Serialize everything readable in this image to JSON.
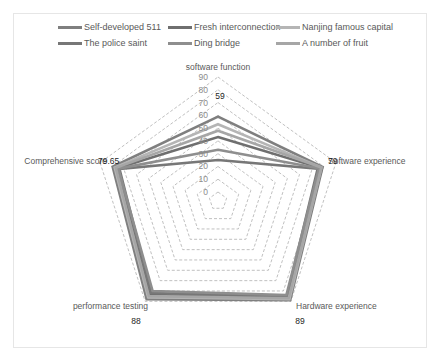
{
  "chart_data": {
    "type": "radar",
    "title": "",
    "axes": [
      "software function",
      "Software experience",
      "Hardware experience",
      "performance testing",
      "Comprehensive score"
    ],
    "rlim": [
      0,
      90
    ],
    "ticks": [
      "0",
      "10",
      "20",
      "30",
      "40",
      "50",
      "60",
      "70",
      "80",
      "90"
    ],
    "grid": true,
    "legend_position": "top",
    "series": [
      {
        "name": "Self-developed 511",
        "color": "#7f7f7f",
        "values": [
          59,
          79,
          89,
          88,
          79.65
        ]
      },
      {
        "name": "Fresh interconnection",
        "color": "#6f6f6f",
        "values": [
          43,
          77,
          86,
          84,
          76
        ]
      },
      {
        "name": "Nanjing famous capital",
        "color": "#b5b5b5",
        "values": [
          53,
          78,
          88,
          86,
          78
        ]
      },
      {
        "name": "The police saint",
        "color": "#777777",
        "values": [
          25,
          75,
          85,
          82,
          74
        ]
      },
      {
        "name": "Ding bridge",
        "color": "#8e8e8e",
        "values": [
          33,
          76,
          84,
          80,
          75
        ]
      },
      {
        "name": "A number of fruit",
        "color": "#a6a6a6",
        "values": [
          48,
          78,
          87,
          85,
          77
        ]
      }
    ],
    "data_labels": [
      {
        "axis": "software function",
        "text": "59"
      },
      {
        "axis": "Software experience",
        "text": "79"
      },
      {
        "axis": "Hardware experience",
        "text": "89"
      },
      {
        "axis": "performance testing",
        "text": "88"
      },
      {
        "axis": "Comprehensive score",
        "text": "79.65"
      }
    ]
  },
  "legend": {
    "items": [
      {
        "label": "Self-developed 511",
        "color": "#7f7f7f"
      },
      {
        "label": "Fresh interconnection",
        "color": "#6f6f6f"
      },
      {
        "label": "Nanjing famous capital",
        "color": "#b5b5b5"
      },
      {
        "label": "The police saint",
        "color": "#777777"
      },
      {
        "label": "Ding bridge",
        "color": "#8e8e8e"
      },
      {
        "label": "A number of fruit",
        "color": "#a6a6a6"
      }
    ]
  },
  "axis_labels": {
    "top": "software function",
    "right": "Software experience",
    "bottom_right": "Hardware experience",
    "bottom_left": "performance testing",
    "left": "Comprehensive score"
  },
  "value_labels": {
    "top": "59",
    "right": "79",
    "bottom_right": "89",
    "bottom_left": "88",
    "left": "79.65"
  }
}
